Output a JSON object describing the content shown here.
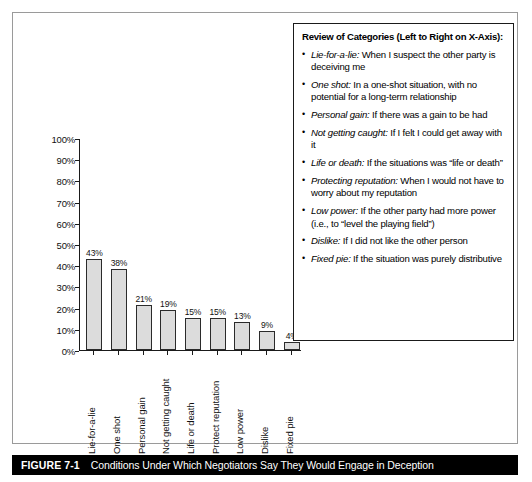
{
  "chart_data": {
    "type": "bar",
    "title": "",
    "xlabel": "",
    "ylabel": "",
    "ylim": [
      0,
      100
    ],
    "grid": false,
    "legend_position": "right-box",
    "categories": [
      "Lie-for-a-lie",
      "One shot",
      "Personal gain",
      "Not getting caught",
      "Life or death",
      "Protect reputation",
      "Low power",
      "Dislike",
      "Fixed pie"
    ],
    "values": [
      43,
      38,
      21,
      19,
      15,
      15,
      13,
      9,
      4
    ],
    "value_labels": [
      "43%",
      "38%",
      "21%",
      "19%",
      "15%",
      "15%",
      "13%",
      "9%",
      "4%"
    ],
    "y_ticks": [
      0,
      10,
      20,
      30,
      40,
      50,
      60,
      70,
      80,
      90,
      100
    ],
    "y_tick_labels": [
      "0%",
      "10%",
      "20%",
      "30%",
      "40%",
      "50%",
      "60%",
      "70%",
      "80%",
      "90%",
      "100%"
    ],
    "bar_fill_color": "#dcdcdc",
    "bar_border_color": "#2b2b2b"
  },
  "review_box": {
    "title": "Review of Categories (Left to Right on X-Axis):",
    "bullet": "•",
    "items": [
      {
        "term": "Lie-for-a-lie:",
        "description": " When I suspect the other party is deceiving me"
      },
      {
        "term": "One shot:",
        "description": " In a one-shot situation, with no potential for a long-term relationship"
      },
      {
        "term": "Personal gain:",
        "description": " If there was a gain to be had"
      },
      {
        "term": "Not getting caught:",
        "description": " If I felt I could get away with it"
      },
      {
        "term": "Life or death:",
        "description": " If the situations was “life or death”"
      },
      {
        "term": "Protecting reputation:",
        "description": " When I would not have to worry about my reputation"
      },
      {
        "term": "Low power:",
        "description": " If the other party had more power (i.e., to “level the playing field”)"
      },
      {
        "term": "Dislike:",
        "description": " If I did not like the other person"
      },
      {
        "term": "Fixed pie:",
        "description": " If the situation was purely distributive"
      }
    ]
  },
  "caption": {
    "number": "FIGURE 7-1",
    "text": "Conditions Under Which Negotiators Say They Would Engage in Deception"
  }
}
